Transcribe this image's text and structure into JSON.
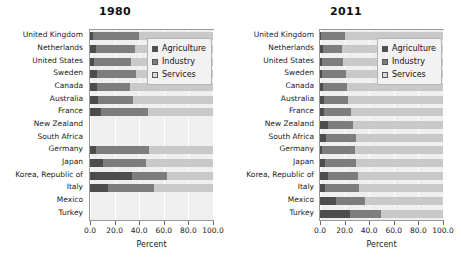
{
  "figure": {
    "axis_title": "Percent",
    "x_ticks": [
      "0.0",
      "20.0",
      "40.0",
      "60.0",
      "80.0",
      "100.0"
    ],
    "legend": {
      "agriculture": "Agriculture",
      "industry": "Industry",
      "services": "Services"
    },
    "colors": {
      "agriculture": "#4d4d4d",
      "industry": "#7d7d7d",
      "services": "#c9c9c9",
      "plot_background": "#efefef",
      "legend_background": "#f2f2f2"
    }
  },
  "panels": [
    {
      "title": "1980"
    },
    {
      "title": "2011"
    }
  ],
  "chart_data": [
    {
      "type": "bar",
      "orientation": "horizontal",
      "stacked": true,
      "title": "1980",
      "xlabel": "Percent",
      "ylabel": "",
      "xlim": [
        0,
        100
      ],
      "grid": true,
      "legend_position": "upper-right-inside",
      "categories": [
        "United Kingdom",
        "Netherlands",
        "United States",
        "Sweden",
        "Canada",
        "Australia",
        "France",
        "New Zealand",
        "South Africa",
        "Germany",
        "Japan",
        "Korea, Republic of",
        "Italy",
        "Mexico",
        "Turkey"
      ],
      "series": [
        {
          "name": "Agriculture",
          "values": [
            2.6,
            4.8,
            3.6,
            5.6,
            5.4,
            6.5,
            8.7,
            null,
            null,
            5.2,
            10.4,
            34.0,
            14.3,
            null,
            null
          ]
        },
        {
          "name": "Industry",
          "values": [
            37.5,
            31.6,
            29.5,
            32.0,
            27.1,
            28.6,
            38.3,
            null,
            null,
            42.7,
            34.9,
            28.5,
            37.6,
            null,
            null
          ]
        },
        {
          "name": "Services",
          "values": [
            59.9,
            63.6,
            66.9,
            62.4,
            67.5,
            64.9,
            53.0,
            null,
            null,
            52.1,
            54.7,
            37.5,
            48.1,
            null,
            null
          ]
        }
      ]
    },
    {
      "type": "bar",
      "orientation": "horizontal",
      "stacked": true,
      "title": "2011",
      "xlabel": "Percent",
      "ylabel": "",
      "xlim": [
        0,
        100
      ],
      "grid": true,
      "legend_position": "upper-right-inside",
      "categories": [
        "United Kingdom",
        "Netherlands",
        "United States",
        "Sweden",
        "Canada",
        "Australia",
        "France",
        "New Zealand",
        "South Africa",
        "Germany",
        "Japan",
        "Korea, Republic of",
        "Italy",
        "Mexico",
        "Turkey"
      ],
      "series": [
        {
          "name": "Agriculture",
          "values": [
            1.2,
            2.6,
            1.6,
            2.0,
            2.4,
            3.3,
            2.9,
            6.7,
            4.6,
            1.6,
            3.7,
            6.6,
            3.8,
            13.4,
            24.0
          ]
        },
        {
          "name": "Industry",
          "values": [
            18.9,
            15.4,
            17.3,
            18.8,
            19.4,
            19.4,
            22.0,
            20.0,
            24.7,
            26.8,
            25.3,
            24.5,
            27.9,
            23.6,
            25.8
          ]
        },
        {
          "name": "Services",
          "values": [
            79.9,
            82.0,
            81.1,
            79.2,
            78.2,
            77.3,
            75.1,
            73.3,
            70.7,
            71.6,
            71.0,
            68.9,
            68.3,
            63.0,
            50.2
          ]
        }
      ]
    }
  ]
}
